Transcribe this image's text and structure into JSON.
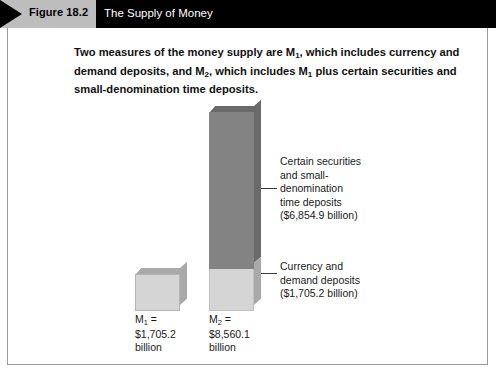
{
  "header": {
    "figure_number": "Figure 18.2",
    "title": "The Supply of Money",
    "banner_color": "#bdbdbd",
    "bar_color": "#000000"
  },
  "caption": {
    "line1_a": "Two measures of the money supply are M",
    "line1_sub": "1",
    "line1_b": ", which includes currency and demand deposits, and M",
    "line2_sub": "2",
    "line2_b": ", which includes M",
    "line3_sub": "1",
    "line3_b": " plus certain securities and small-denomination time deposits.",
    "full_text": "Two measures of the money supply are M1, which includes currency and demand deposits, and M2, which includes M1 plus certain securities and small-denomination time deposits."
  },
  "labels": {
    "m1": {
      "symbol": "M",
      "subscript": "1",
      "equals": " =",
      "value": "$1,705.2",
      "unit": "billion"
    },
    "m2": {
      "symbol": "M",
      "subscript": "2",
      "equals": " =",
      "value": "$8,560.1",
      "unit": "billion"
    }
  },
  "callouts": {
    "securities": "Certain securities\nand small-\ndenomination\ntime deposits\n($6,854.9 billion)",
    "currency": "Currency and\ndemand deposits\n($1,705.2 billion)"
  },
  "colors": {
    "securities_segment": "#838383",
    "currency_segment": "#d5d5d5",
    "bar_side_dark": "#6a6a6a",
    "bar_side_light": "#a9a9a9"
  },
  "chart_data": {
    "type": "bar",
    "title": "The Supply of Money",
    "categories": [
      "M1",
      "M2"
    ],
    "xlabel": "",
    "ylabel": "",
    "unit": "billions of dollars",
    "ylim": [
      0,
      8560.1
    ],
    "grid": false,
    "legend_position": "annotations-right",
    "values": [
      1705.2,
      8560.1
    ],
    "series": [
      {
        "name": "Currency and demand deposits",
        "values": [
          1705.2,
          1705.2
        ],
        "color": "#d5d5d5"
      },
      {
        "name": "Certain securities and small-denomination time deposits",
        "values": [
          0,
          6854.9
        ],
        "color": "#838383"
      }
    ],
    "annotations": [
      {
        "text": "Certain securities and small-denomination time deposits ($6,854.9 billion)",
        "value": 6854.9,
        "target": "M2-upper-segment"
      },
      {
        "text": "Currency and demand deposits ($1,705.2 billion)",
        "value": 1705.2,
        "target": "M2-lower-segment"
      }
    ],
    "data_labels": [
      "M1 = $1,705.2 billion",
      "M2 = $8,560.1 billion"
    ]
  }
}
